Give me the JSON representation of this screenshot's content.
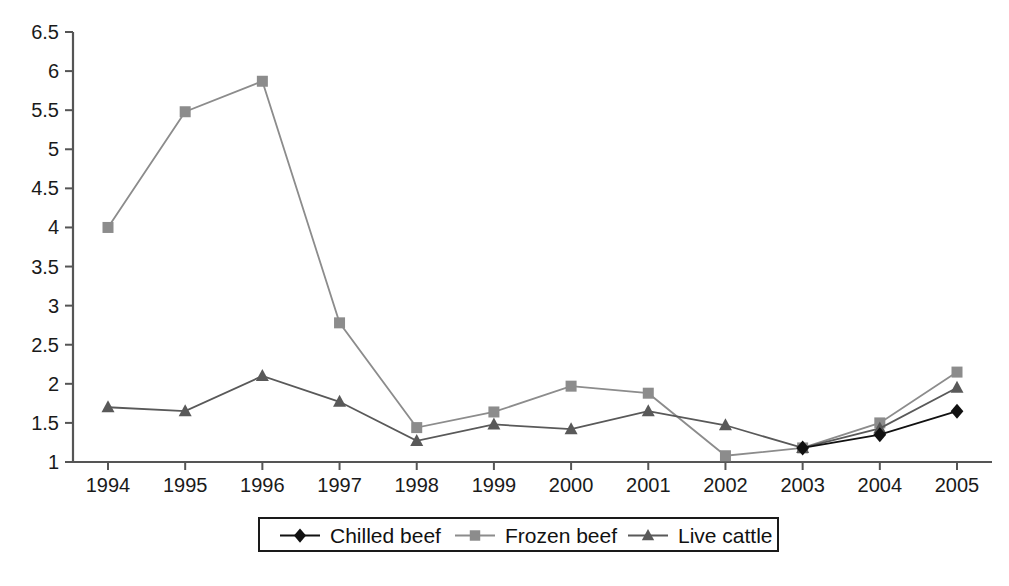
{
  "chart_data": {
    "type": "line",
    "title": "",
    "xlabel": "",
    "ylabel": "",
    "grid": false,
    "legend_position": "bottom",
    "categories": [
      "1994",
      "1995",
      "1996",
      "1997",
      "1998",
      "1999",
      "2000",
      "2001",
      "2002",
      "2003",
      "2004",
      "2005"
    ],
    "x": [
      1994,
      1995,
      1996,
      1997,
      1998,
      1999,
      2000,
      2001,
      2002,
      2003,
      2004,
      2005
    ],
    "ylim": [
      1,
      6.5
    ],
    "yticks": [
      "1",
      "1.5",
      "2",
      "2.5",
      "3",
      "3.5",
      "4",
      "4.5",
      "5",
      "5.5",
      "6",
      "6.5"
    ],
    "ytick_values": [
      1,
      1.5,
      2,
      2.5,
      3,
      3.5,
      4,
      4.5,
      5,
      5.5,
      6,
      6.5
    ],
    "series": [
      {
        "name": "Chilled beef",
        "marker": "diamond",
        "color": "#111111",
        "values": [
          null,
          null,
          null,
          null,
          null,
          null,
          null,
          null,
          null,
          1.18,
          1.35,
          1.65
        ]
      },
      {
        "name": "Frozen beef",
        "marker": "square",
        "color": "#8c8c8c",
        "values": [
          4.0,
          5.48,
          5.87,
          2.78,
          1.44,
          1.64,
          1.97,
          1.88,
          1.08,
          1.18,
          1.5,
          2.15
        ]
      },
      {
        "name": "Live cattle",
        "marker": "triangle",
        "color": "#595959",
        "values": [
          1.7,
          1.65,
          2.1,
          1.77,
          1.27,
          1.48,
          1.42,
          1.65,
          1.47,
          1.18,
          1.43,
          1.95
        ]
      }
    ]
  },
  "legend": {
    "items": [
      {
        "label": "Chilled beef",
        "color": "#111111",
        "marker": "diamond"
      },
      {
        "label": "Frozen beef",
        "color": "#8c8c8c",
        "marker": "square"
      },
      {
        "label": "Live cattle",
        "color": "#595959",
        "marker": "triangle"
      }
    ]
  },
  "caption": {
    "text": ""
  }
}
